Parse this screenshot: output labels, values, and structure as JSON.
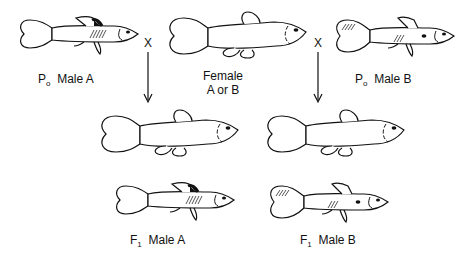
{
  "parents": {
    "male_a": {
      "prefix": "P",
      "subscript": "o",
      "label": "Male A"
    },
    "female": {
      "line1": "Female",
      "line2": "A or B"
    },
    "male_b": {
      "prefix": "P",
      "subscript": "o",
      "label": "Male B"
    }
  },
  "cross_symbol": "X",
  "offspring": {
    "male_a": {
      "prefix": "F",
      "subscript": "1",
      "label": "Male A"
    },
    "male_b": {
      "prefix": "F",
      "subscript": "1",
      "label": "Male B"
    }
  },
  "colors": {
    "stroke": "#111111",
    "background": "#ffffff"
  }
}
